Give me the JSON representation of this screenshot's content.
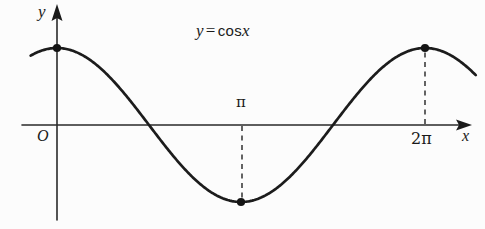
{
  "figure": {
    "background_color": "#fcfcfc",
    "ink_color": "#1a1a1a",
    "title": {
      "lhs": "y",
      "equals": "=",
      "fn": "cos",
      "arg": "x",
      "full": "y = cos x"
    },
    "axes": {
      "x_label": "x",
      "y_label": "y",
      "origin_label": "O"
    },
    "ticks": {
      "x": [
        {
          "label": "π",
          "value": 3.14159,
          "position": "above-axis"
        },
        {
          "label": "2π",
          "value": 6.28319,
          "position": "below-axis"
        }
      ]
    }
  },
  "chart_data": {
    "type": "line",
    "xlabel": "x",
    "ylabel": "y",
    "xlim": [
      -0.45,
      7.15
    ],
    "ylim": [
      -1.35,
      1.55
    ],
    "grid": false,
    "legend": null,
    "series": [
      {
        "name": "y = cos x",
        "expression": "cos(x)",
        "x": [
          -0.45,
          -0.3,
          -0.15,
          0,
          0.3926,
          0.7854,
          1.1781,
          1.5708,
          1.9635,
          2.3562,
          2.7489,
          3.1416,
          3.5343,
          3.927,
          4.3197,
          4.7124,
          5.1051,
          5.4978,
          5.8905,
          6.2832,
          6.5,
          6.75,
          7.0,
          7.15
        ],
        "y": [
          0.9004,
          0.9553,
          0.9888,
          1.0,
          0.9239,
          0.7071,
          0.3827,
          0.0,
          -0.3827,
          -0.7071,
          -0.9239,
          -1.0,
          -0.9239,
          -0.7071,
          -0.3827,
          0.0,
          0.3827,
          0.7071,
          0.9239,
          1.0,
          0.9776,
          0.9139,
          0.7539,
          0.6329
        ]
      }
    ],
    "marked_points": [
      {
        "x": 0,
        "y": 1,
        "label_x": "0",
        "label_y": "1",
        "style": "filled-dot",
        "dashed_guide": false
      },
      {
        "x": 3.14159,
        "y": -1,
        "label_x": "π",
        "label_y": "-1",
        "style": "filled-dot",
        "dashed_guide": true
      },
      {
        "x": 6.28319,
        "y": 1,
        "label_x": "2π",
        "label_y": "1",
        "style": "filled-dot",
        "dashed_guide": true
      }
    ],
    "zero_crossings": [
      1.5708,
      4.7124
    ],
    "annotations": [
      {
        "text": "y = cos x",
        "x": 3.4,
        "y": 1.42,
        "role": "equation-title"
      },
      {
        "text": "O",
        "x": -0.2,
        "y": -0.16,
        "role": "origin"
      },
      {
        "text": "π",
        "x": 3.14159,
        "y": 0.22,
        "role": "x-tick"
      },
      {
        "text": "2π",
        "x": 6.28319,
        "y": -0.2,
        "role": "x-tick"
      },
      {
        "text": "x",
        "x": 7.05,
        "y": -0.15,
        "role": "axis-name"
      },
      {
        "text": "y",
        "x": -0.3,
        "y": 1.48,
        "role": "axis-name"
      }
    ]
  }
}
